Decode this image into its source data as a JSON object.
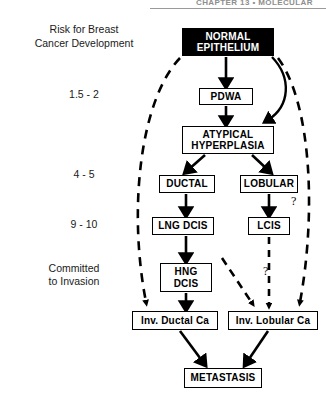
{
  "header": {
    "running_head": "CHAPTER 13 • MOLECULAR"
  },
  "risk_column": {
    "heading": "Risk for Breast\nCancer Development",
    "levels": [
      {
        "label": "1.5 - 2"
      },
      {
        "label": "4 - 5"
      },
      {
        "label": "9 - 10"
      },
      {
        "label": "Committed\nto Invasion"
      }
    ]
  },
  "diagram": {
    "nodes": {
      "normal_epithelium": "NORMAL\nEPITHELIUM",
      "pdwa": "PDWA",
      "atypical_hyperplasia": "ATYPICAL\nHYPERPLASIA",
      "ductal": "DUCTAL",
      "lobular": "LOBULAR",
      "lng_dcis": "LNG DCIS",
      "lcis": "LCIS",
      "hng_dcis": "HNG\nDCIS",
      "inv_ductal_ca": "Inv. Ductal Ca",
      "inv_lobular_ca": "Inv. Lobular Ca",
      "metastasis": "METASTASIS"
    },
    "annotations": {
      "question_right": "?",
      "question_middle": "?"
    },
    "colors": {
      "stroke": "#000000",
      "inverted_fill": "#000000",
      "inverted_text": "#ffffff",
      "background": "#ffffff"
    }
  }
}
